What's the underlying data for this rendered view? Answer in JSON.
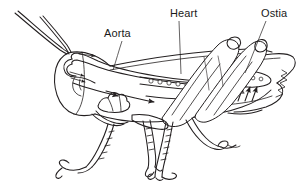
{
  "figure": {
    "type": "line-art anatomical diagram",
    "background_color": "#ffffff",
    "line_color": "#231f20",
    "width": 304,
    "height": 183
  },
  "labels": [
    {
      "id": "aorta",
      "text": "Aorta",
      "x": 104,
      "y": 27,
      "leader": {
        "from_x": 122,
        "from_y": 41,
        "to_x": 113,
        "to_y": 70
      }
    },
    {
      "id": "heart",
      "text": "Heart",
      "x": 170,
      "y": 7,
      "leader": {
        "from_x": 179,
        "from_y": 21,
        "to_x": 181,
        "to_y": 74
      }
    },
    {
      "id": "ostia",
      "text": "Ostia",
      "x": 261,
      "y": 7,
      "leader": {
        "from_x": 266,
        "from_y": 21,
        "to_x": 245,
        "to_y": 73
      }
    }
  ],
  "structures": {
    "heart_chambers": {
      "name": "heart tube with ostia openings",
      "circle_count": 5
    },
    "ostia_cluster": {
      "name": "ostia oval with inflow arrows",
      "circle_count": 4,
      "arrow_count": 5
    },
    "aorta_loop": {
      "name": "aorta loop in head",
      "arrow_count": 3
    },
    "hemolymph_arrows": {
      "name": "hemolymph flow arrows in body cavity",
      "arrow_count": 5
    },
    "antennae": {
      "count": 2
    },
    "legs": {
      "count": 6,
      "note": "fore, mid and hind legs visible"
    },
    "wings": {
      "count": 2,
      "note": "folded wing over abdomen"
    }
  }
}
